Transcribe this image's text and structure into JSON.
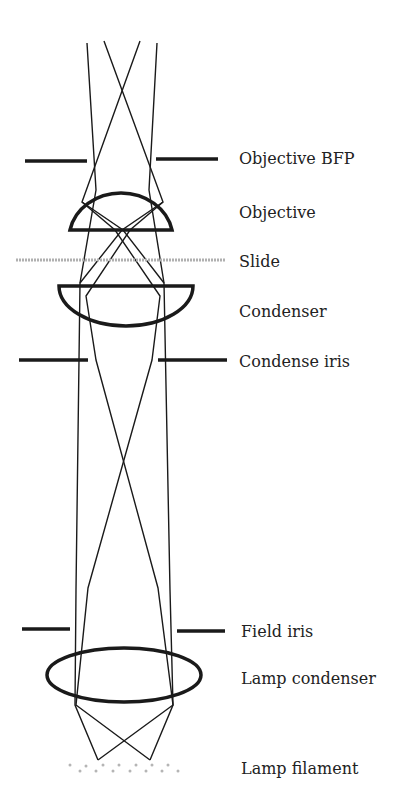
{
  "diagram": {
    "type": "optical-path",
    "colors": {
      "stroke": "#1a1a1a",
      "slide": "#b0b0b0",
      "filament": "#b5b5b5",
      "text": "#222222"
    },
    "labels": [
      {
        "id": "objective-bfp",
        "text": "Objective BFP",
        "y": 159
      },
      {
        "id": "objective",
        "text": "Objective",
        "y": 213
      },
      {
        "id": "slide",
        "text": "Slide",
        "y": 262
      },
      {
        "id": "condenser",
        "text": "Condenser",
        "y": 312
      },
      {
        "id": "condense-iris",
        "text": "Condense iris",
        "y": 362
      },
      {
        "id": "field-iris",
        "text": "Field iris",
        "y": 632
      },
      {
        "id": "lamp-condenser",
        "text": "Lamp condenser",
        "y": 679
      },
      {
        "id": "lamp-filament",
        "text": "Lamp filament",
        "y": 769
      }
    ]
  }
}
